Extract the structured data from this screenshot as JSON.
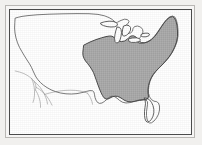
{
  "figure": {
    "type": "thematic-range-map",
    "caption": ""
  },
  "colors": {
    "page_background": "#f1f0ee",
    "frame_outer_rule": "#b9b7b4",
    "frame_outer_fill": "#f6f5f4",
    "frame_inner_rule": "#4a4a4a",
    "map_field": "#ffffff",
    "land_outline": "#4f4f4f",
    "state_outline": "#8a8a8a",
    "range_shading": "#a9a9a9",
    "range_outline": "#3c3c3c",
    "lake_fill": "#ffffff",
    "lake_outline": "#3c3c3c"
  },
  "frame": {
    "outer": {
      "x": 5,
      "y": 5,
      "width": 190,
      "height": 133,
      "stroke_width": 1
    },
    "inner": {
      "x": 9,
      "y": 9,
      "width": 183,
      "height": 126,
      "stroke_width": 1
    }
  },
  "legend": {
    "present": false,
    "entries": [
      {
        "label": "Shaded range",
        "swatch": "#a9a9a9"
      },
      {
        "label": "Outside range",
        "swatch": "#ffffff"
      }
    ]
  },
  "labels": {
    "title": "",
    "scale_bar": "",
    "north_arrow": "",
    "tick_labels": []
  },
  "regions": {
    "shaded_range_name": "eastern-and-midwestern-united-states",
    "excluded_from_range": [
      "Florida peninsula",
      "Great Lakes"
    ],
    "great_lakes": [
      "Superior",
      "Michigan",
      "Huron",
      "Erie",
      "Ontario"
    ]
  },
  "geometry": {
    "national_outline": "M 14.5 17.0 L 17.5 16.2 L 21.0 15.4 L 27.0 14.6 L 36.0 13.8 L 48.0 13.2 L 62.0 12.8 L 76.0 12.6 L 88.0 12.7 L 97.0 13.4 L 103.5 14.8 L 108.0 16.6 L 111.5 18.6 L 113.5 20.6 L 114.0 22.4 L 116.5 21.2 L 120.0 19.4 L 123.5 18.2 L 126.5 18.6 L 128.0 20.4 L 127.0 22.6 L 124.5 24.6 L 122.5 26.6 L 122.0 29.0 L 123.5 31.2 L 126.5 32.4 L 129.5 32.0 L 131.5 30.2 L 132.0 27.6 L 133.5 25.6 L 136.5 25.0 L 139.5 26.0 L 141.5 28.2 L 142.0 31.0 L 141.0 34.0 L 139.0 36.6 L 137.0 38.8 L 136.5 41.0 L 138.5 42.4 L 142.0 42.2 L 146.0 41.0 L 150.0 38.6 L 153.5 35.2 L 156.5 31.2 L 159.5 26.8 L 162.5 22.4 L 165.5 18.6 L 168.5 16.0 L 171.5 15.0 L 174.0 16.2 L 175.5 19.4 L 176.5 24.0 L 177.0 29.4 L 177.0 35.0 L 176.0 40.6 L 174.0 46.0 L 171.5 51.0 L 168.5 55.6 L 165.0 59.8 L 161.5 63.6 L 158.0 67.0 L 155.0 70.2 L 152.5 73.4 L 150.5 76.8 L 149.0 80.4 L 148.0 84.2 L 147.5 88.2 L 147.5 92.2 L 148.5 95.8 L 150.5 98.6 L 153.0 100.2 L 155.5 100.6 L 157.5 102.0 L 158.5 105.0 L 158.5 109.0 L 157.5 113.2 L 155.5 117.0 L 153.0 120.0 L 150.5 121.8 L 148.5 122.0 L 147.0 120.6 L 146.0 118.0 L 145.5 114.6 L 145.5 110.8 L 146.0 107.0 L 146.5 103.6 L 146.5 100.8 L 145.0 99.0 L 142.0 98.4 L 138.0 99.0 L 133.5 100.4 L 129.0 101.6 L 125.0 102.0 L 121.5 101.2 L 118.5 99.4 L 116.0 97.2 L 113.5 95.6 L 111.0 95.2 L 108.5 96.2 L 106.0 98.2 L 103.5 100.4 L 101.0 102.0 L 98.5 102.4 L 96.5 101.4 L 95.0 99.2 L 94.0 96.4 L 93.5 93.6 L 93.0 91.2 L 91.5 89.8 L 89.0 89.6 L 85.5 90.4 L 81.0 91.6 L 76.0 92.6 L 70.5 93.0 L 65.0 92.8 L 59.5 92.0 L 54.5 90.6 L 50.0 88.8 L 46.0 86.6 L 42.5 84.2 L 39.5 81.6 L 37.0 78.8 L 35.0 76.0 L 33.5 73.0 L 32.0 69.8 L 30.5 66.4 L 28.5 62.8 L 26.0 59.0 L 23.5 55.0 L 21.0 50.8 L 18.5 46.4 L 16.5 41.8 L 15.0 37.0 L 14.0 32.0 L 13.6 27.0 L 13.8 22.0 Z",
    "range_boundary": "M 83.0 44.0 L 89.0 41.0 L 95.0 38.6 L 100.5 36.8 L 105.0 35.6 L 108.5 35.0 L 111.0 35.2 L 113.0 36.4 L 115.0 38.4 L 117.5 40.0 L 120.5 40.6 L 123.5 40.0 L 126.0 38.4 L 128.0 36.4 L 130.0 35.0 L 132.5 34.8 L 135.0 36.0 L 137.0 38.0 L 138.5 40.2 L 140.5 41.6 L 143.5 41.8 L 147.0 40.8 L 150.5 38.6 L 154.0 35.2 L 157.0 31.0 L 160.0 26.4 L 163.0 22.0 L 166.0 18.4 L 169.0 16.2 L 171.5 15.6 L 173.5 17.0 L 175.0 20.2 L 176.0 24.6 L 176.5 30.0 L 176.5 35.6 L 175.5 41.0 L 173.5 46.4 L 171.0 51.4 L 168.0 56.0 L 164.5 60.2 L 161.0 64.0 L 157.5 67.4 L 154.5 70.6 L 152.0 73.8 L 150.0 77.2 L 148.5 80.8 L 147.5 84.6 L 147.0 88.4 L 147.0 92.0 L 147.5 95.0 L 147.0 97.4 L 145.0 98.6 L 142.0 99.0 L 138.5 99.4 L 134.5 100.2 L 130.5 100.8 L 127.0 100.6 L 124.0 99.6 L 121.5 98.0 L 119.0 96.4 L 116.5 95.4 L 114.0 95.2 L 111.5 95.8 L 109.0 97.0 L 107.0 98.0 L 105.0 98.0 L 103.0 96.8 L 101.5 94.6 L 100.0 91.6 L 98.5 88.0 L 97.0 84.0 L 95.5 79.8 L 94.0 75.6 L 92.5 71.6 L 90.5 68.0 L 88.5 65.0 L 86.5 62.4 L 84.5 60.0 L 83.0 57.4 L 82.0 54.6 L 81.8 51.6 L 82.2 48.2 Z",
    "florida_cutout": "M 143.5 97.0 L 146.0 97.4 L 148.5 98.8 L 150.5 101.4 L 152.0 104.6 L 152.8 108.2 L 152.8 111.8 L 152.0 115.2 L 150.5 118.2 L 148.5 120.4 L 146.5 121.2 L 145.0 120.2 L 144.0 117.8 L 143.5 114.4 L 143.5 110.4 L 144.0 106.4 L 144.5 102.8 L 144.2 99.8 Z",
    "lake_superior": "M 99.5 22.0 L 103.5 20.8 L 108.0 20.2 L 112.0 20.4 L 115.0 21.4 L 116.5 23.0 L 116.0 24.8 L 113.5 25.8 L 110.0 26.0 L 106.0 25.6 L 102.5 24.6 L 100.0 23.4 Z",
    "lake_michigan": "M 116.0 26.0 L 118.5 26.4 L 120.0 28.4 L 120.5 31.6 L 120.0 35.4 L 119.0 39.0 L 117.5 41.4 L 115.5 42.0 L 114.0 40.4 L 113.5 37.2 L 114.0 33.4 L 114.8 29.8 Z",
    "lake_huron": "M 122.5 25.0 L 125.5 24.2 L 128.0 24.6 L 129.5 26.4 L 129.5 29.2 L 128.0 32.0 L 125.5 34.2 L 123.0 35.2 L 121.5 34.2 L 121.2 31.8 L 121.6 28.6 Z",
    "lake_erie": "M 127.5 37.8 L 131.5 37.0 L 135.5 36.8 L 138.5 37.6 L 139.5 39.2 L 138.0 40.6 L 134.5 41.4 L 130.5 41.4 L 127.8 40.4 Z",
    "lake_ontario": "M 140.5 33.0 L 144.0 32.2 L 147.0 32.2 L 148.5 33.2 L 147.8 34.8 L 145.0 35.8 L 141.8 35.8 L 139.8 34.8 Z",
    "state_lines": [
      "M 14.2 70.0 L 18.5 71.0 L 23.0 72.6 L 27.0 74.8 L 30.5 77.4 L 33.0 80.2 L 34.5 83.2 L 35.0 86.2 L 34.5 89.0",
      "M 30.5 77.4 L 32.0 81.0 L 33.0 85.2 L 33.5 89.6 L 33.5 94.0 L 33.0 98.0 L 32.0 101.4",
      "M 33.0 80.2 L 36.0 83.0 L 39.0 86.2 L 41.5 89.8 L 43.5 93.4 L 45.0 97.0 L 46.0 100.2 L 46.5 103.0",
      "M 35.0 86.2 L 38.5 88.4 L 42.0 91.2 L 45.0 94.4 L 47.5 97.8 L 49.5 101.2 L 51.0 104.2",
      "M 34.5 89.0 L 36.5 92.6 L 38.0 96.4 L 39.0 100.2 L 39.5 103.6 L 39.5 106.4",
      "M 43.5 93.4 L 48.0 92.2 L 53.0 91.0 L 58.5 90.0 L 64.0 89.4 L 69.5 89.2 L 74.5 89.4 L 79.0 90.0 L 83.0 91.0 L 86.5 92.2",
      "M 86.5 92.2 L 88.5 95.0 L 90.0 98.0 L 91.0 100.8 L 91.5 103.2"
    ]
  }
}
